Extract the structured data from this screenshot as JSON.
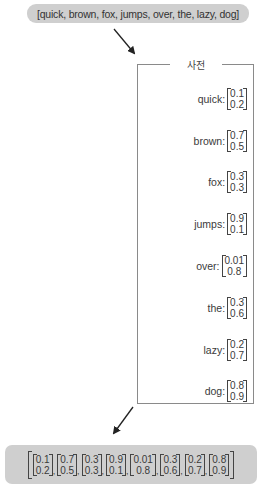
{
  "input_sentence": "[quick,  brown, fox, jumps, over, the, lazy, dog]",
  "dictionary": {
    "title": "사전",
    "entries": [
      {
        "word": "quick:",
        "v1": "0.1",
        "v2": "0.2"
      },
      {
        "word": "brown:",
        "v1": "0.7",
        "v2": "0.5"
      },
      {
        "word": "fox:",
        "v1": "0.3",
        "v2": "0.3"
      },
      {
        "word": "jumps:",
        "v1": "0.9",
        "v2": "0.1"
      },
      {
        "word": "over:",
        "v1": "0.01",
        "v2": "0.8"
      },
      {
        "word": "the:",
        "v1": "0.3",
        "v2": "0.6"
      },
      {
        "word": "lazy:",
        "v1": "0.2",
        "v2": "0.7"
      },
      {
        "word": "dog:",
        "v1": "0.8",
        "v2": "0.9"
      }
    ]
  },
  "output_vectors": [
    {
      "v1": "0.1",
      "v2": "0.2",
      "sep": ","
    },
    {
      "v1": "0.7",
      "v2": "0.5",
      "sep": ","
    },
    {
      "v1": "0.3",
      "v2": "0.3",
      "sep": ","
    },
    {
      "v1": "0.9",
      "v2": "0.1",
      "sep": ","
    },
    {
      "v1": "0.01",
      "v2": "0.8",
      "sep": ","
    },
    {
      "v1": "0.3",
      "v2": "0.6",
      "sep": ","
    },
    {
      "v1": "0.2",
      "v2": "0.7",
      "sep": ","
    },
    {
      "v1": "0.8",
      "v2": "0.9",
      "sep": ""
    }
  ]
}
